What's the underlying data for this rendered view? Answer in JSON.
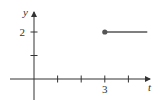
{
  "chart_data": {
    "type": "line",
    "title": "",
    "xlabel": "t",
    "ylabel": "y",
    "xlim": [
      -1,
      4.8
    ],
    "ylim": [
      -1,
      2.8
    ],
    "x_ticks": [
      1,
      2,
      3,
      4
    ],
    "x_tick_labels": [
      "",
      "",
      "3",
      ""
    ],
    "y_ticks": [
      1,
      2
    ],
    "y_tick_labels": [
      "",
      "2"
    ],
    "grid": false,
    "series": [
      {
        "name": "step",
        "x": [
          3,
          4.8
        ],
        "y": [
          2,
          2
        ],
        "start_marker": "filled-circle"
      }
    ],
    "colors": {
      "axis": "#333333",
      "line": "#555555",
      "marker": "#555555"
    }
  }
}
